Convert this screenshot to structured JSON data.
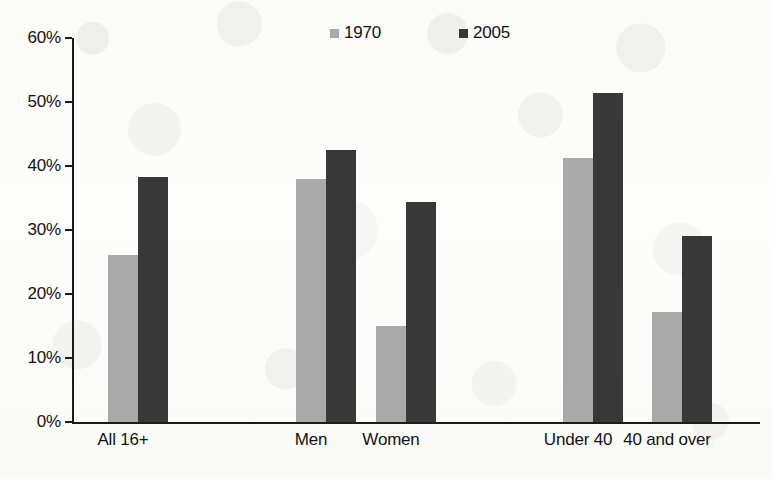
{
  "chart_data": {
    "type": "bar",
    "title": "",
    "subtitle": "",
    "xlabel": "",
    "ylabel": "",
    "categories": [
      "All 16+",
      "Men",
      "Women",
      "Under 40",
      "40 and over"
    ],
    "series": [
      {
        "name": "1970",
        "color": "#a9a9a9",
        "values": [
          26.1,
          38.0,
          15.0,
          41.2,
          17.2
        ]
      },
      {
        "name": "2005",
        "color": "#383838",
        "values": [
          38.3,
          42.5,
          34.4,
          51.4,
          29.0
        ]
      }
    ],
    "ylim": [
      0,
      60
    ],
    "y_ticks": [
      "0%",
      "10%",
      "20%",
      "30%",
      "40%",
      "50%",
      "60%"
    ],
    "y_tick_values": [
      0,
      10,
      20,
      30,
      40,
      50,
      60
    ],
    "grid": false,
    "legend_position": "top-right",
    "legend_entries": [
      "1970",
      "2005"
    ],
    "axis_color": "#1b1b1b",
    "background_color": "#fdfdfb"
  }
}
